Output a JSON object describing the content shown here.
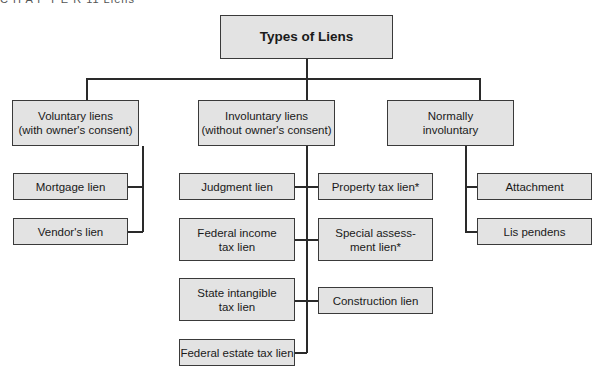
{
  "clipped_header": "C H A P T E R   11   Liens",
  "root": {
    "label": "Types of Liens"
  },
  "categories": [
    {
      "label": "Voluntary liens\n(with owner's consent)",
      "children": [
        "Mortgage lien",
        "Vendor's lien"
      ]
    },
    {
      "label": "Involuntary liens\n(without owner's consent)",
      "left_children": [
        "Judgment lien",
        "Federal income\ntax lien",
        "State intangible\ntax lien",
        "Federal estate tax lien"
      ],
      "right_children": [
        "Property tax lien*",
        "Special assess-\nment lien*",
        "Construction lien"
      ]
    },
    {
      "label": "Normally\ninvoluntary",
      "children": [
        "Attachment",
        "Lis pendens"
      ]
    }
  ],
  "colors": {
    "box_fill": "#e3e3e3",
    "border": "#3a3a3a",
    "line": "#2a2a2a"
  }
}
